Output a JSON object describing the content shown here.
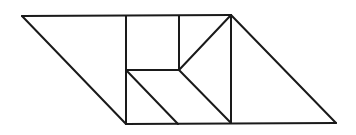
{
  "diagram": {
    "title": "",
    "stroke_color": "#1a1a1a",
    "background": "#ffffff",
    "vertices": {
      "A": [
        22,
        16
      ],
      "B": [
        126,
        16
      ],
      "C": [
        179,
        16
      ],
      "D": [
        231,
        15
      ],
      "E": [
        126,
        70
      ],
      "F": [
        179,
        70
      ],
      "G": [
        126,
        124
      ],
      "H": [
        178,
        124
      ],
      "I": [
        231,
        123
      ],
      "J": [
        336,
        123
      ]
    },
    "edges": [
      {
        "id": "top",
        "from": "A",
        "to": "D"
      },
      {
        "id": "bottom",
        "from": "G",
        "to": "J"
      },
      {
        "id": "left-diagonal",
        "from": "A",
        "to": "G"
      },
      {
        "id": "right-diagonal",
        "from": "D",
        "to": "J"
      },
      {
        "id": "vertical-left",
        "from": "B",
        "to": "G"
      },
      {
        "id": "vertical-middle",
        "from": "C",
        "to": "F"
      },
      {
        "id": "vertical-right",
        "from": "D",
        "to": "I"
      },
      {
        "id": "middle-horizontal",
        "from": "E",
        "to": "F"
      },
      {
        "id": "inner-diagonal-1",
        "from": "E",
        "to": "H"
      },
      {
        "id": "inner-diagonal-2",
        "from": "F",
        "to": "I"
      },
      {
        "id": "inner-diagonal-3",
        "from": "F",
        "to": "D"
      }
    ],
    "pieces": [
      {
        "name": "large-triangle-left",
        "points": [
          "A",
          "B",
          "G"
        ]
      },
      {
        "name": "square",
        "points": [
          "B",
          "C",
          "F",
          "E"
        ]
      },
      {
        "name": "small-triangle-top",
        "points": [
          "C",
          "D",
          "F"
        ]
      },
      {
        "name": "triangle-middle",
        "points": [
          "F",
          "D",
          "I"
        ]
      },
      {
        "name": "small-triangle-bottom-left",
        "points": [
          "E",
          "H",
          "G"
        ]
      },
      {
        "name": "parallelogram",
        "points": [
          "E",
          "F",
          "I",
          "H"
        ]
      },
      {
        "name": "large-triangle-right",
        "points": [
          "D",
          "J",
          "I"
        ]
      }
    ]
  }
}
